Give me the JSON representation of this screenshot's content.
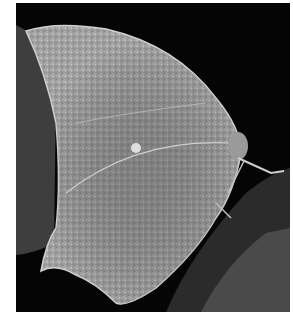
{
  "image": {
    "subject": "leaf-mimic butterfly, wings closed, side view",
    "style": "grayscale photograph",
    "colors": {
      "background": "#050505",
      "wing": "#a8a8a8",
      "wing_dark": "#6e6e6e",
      "leaf_shadow": "#3a3a3a",
      "perch": "#2a2a2a",
      "frame": "#ffffff"
    }
  }
}
